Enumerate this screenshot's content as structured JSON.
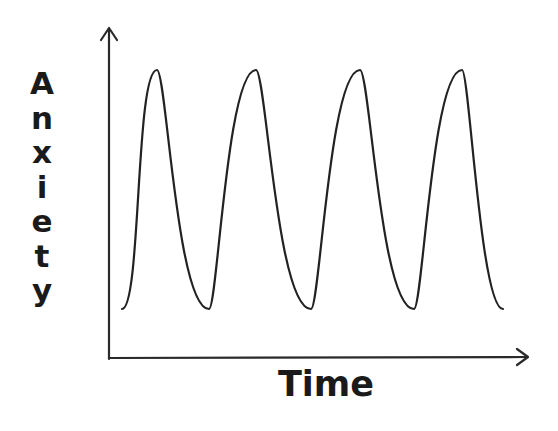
{
  "chart_data": {
    "type": "line",
    "title": "",
    "xlabel": "Time",
    "ylabel": "Anxiety",
    "x_ticks": [],
    "y_ticks": [],
    "grid": false,
    "legend": null,
    "style": "hand-drawn sketch, no numeric scale",
    "series": [
      {
        "name": "Anxiety",
        "description": "Oscillating curve with 4 peaks and 3 troughs, starting and ending low",
        "x": [
          0,
          1,
          2,
          3,
          4,
          5,
          6,
          7,
          8
        ],
        "values": [
          0.05,
          1.0,
          0.05,
          1.0,
          0.05,
          1.0,
          0.05,
          1.0,
          0.05
        ]
      }
    ],
    "ylim": [
      0,
      1.1
    ],
    "color": "#222222"
  },
  "axes": {
    "x_label": "Time",
    "y_label_letters": [
      "A",
      "n",
      "x",
      "i",
      "e",
      "t",
      "y"
    ]
  }
}
